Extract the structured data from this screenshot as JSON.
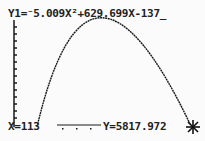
{
  "calculator": {
    "equation": "Y1=⁻5.009X²+629.699X-137_",
    "trace": {
      "x_label": "X=113",
      "y_label": "Y=5817.972"
    },
    "cursor_icon": "trace-cursor-icon"
  },
  "graph": {
    "function": {
      "a": -5.009,
      "b": 629.699,
      "c": -137
    },
    "trace_point": {
      "x": 113,
      "y": 5817.972
    },
    "colors": {
      "background": "#fbfbfb",
      "ink": "#1a1a1a"
    }
  }
}
